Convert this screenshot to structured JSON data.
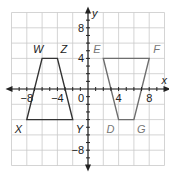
{
  "diagram": {
    "type": "coordinate-plane",
    "axes": {
      "x_label": "x",
      "y_label": "y",
      "origin_label": "0",
      "range": [
        -10,
        10
      ],
      "grid_step": 2,
      "x_ticks": [
        {
          "value": -8,
          "label": "−8"
        },
        {
          "value": -4,
          "label": "−4"
        },
        {
          "value": 4,
          "label": "4"
        },
        {
          "value": 8,
          "label": "8"
        }
      ],
      "y_ticks": [
        {
          "value": 8,
          "label": "8"
        },
        {
          "value": 4,
          "label": "4"
        },
        {
          "value": -8,
          "label": "−8"
        }
      ]
    },
    "shapes": [
      {
        "name": "WZYX",
        "color": "#333333",
        "vertices": [
          {
            "label": "W",
            "x": -6,
            "y": 4,
            "label_color": "#222222"
          },
          {
            "label": "Z",
            "x": -4,
            "y": 4,
            "label_color": "#222222"
          },
          {
            "label": "Y",
            "x": -2,
            "y": -4,
            "label_color": "#222222"
          },
          {
            "label": "X",
            "x": -8,
            "y": -4,
            "label_color": "#222222"
          }
        ]
      },
      {
        "name": "EFGD",
        "color": "#6e6e6e",
        "vertices": [
          {
            "label": "E",
            "x": 2,
            "y": 4,
            "label_color": "#777777"
          },
          {
            "label": "F",
            "x": 8,
            "y": 4,
            "label_color": "#777777"
          },
          {
            "label": "G",
            "x": 6,
            "y": -4,
            "label_color": "#777777"
          },
          {
            "label": "D",
            "x": 4,
            "y": -4,
            "label_color": "#777777"
          }
        ]
      }
    ]
  }
}
